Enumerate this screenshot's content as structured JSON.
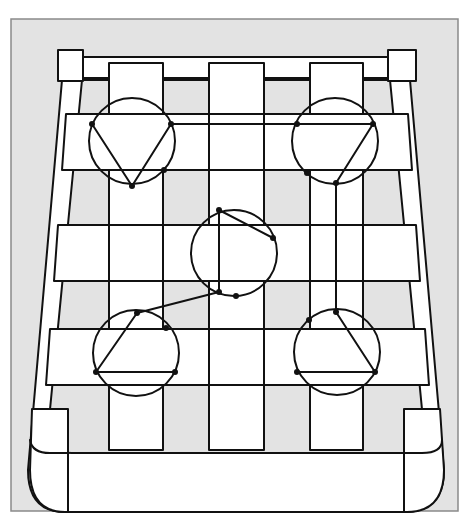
{
  "figure": {
    "title": "Woven strap seat with five-circle traversal path",
    "colors": {
      "panel_background": "#e3e3e3",
      "frame_border": "#8a8a8a",
      "line": "#111111",
      "fill": "#ffffff"
    }
  },
  "panel": {
    "x": 11,
    "y": 19,
    "w": 447,
    "h": 492
  },
  "frame": {
    "top_rail": {
      "x1": 82,
      "y1": 57,
      "x2": 388,
      "y2": 57
    },
    "top_inner": {
      "y": 78
    },
    "corner_blocks_top": [
      {
        "name": "corner-block-top-left",
        "x": 58,
        "y": 50,
        "w": 25,
        "h": 31
      },
      {
        "name": "corner-block-top-right",
        "x": 388,
        "y": 50,
        "w": 28,
        "h": 31
      }
    ],
    "corner_blocks_bottom": [
      {
        "name": "corner-block-bottom-left",
        "x": 32,
        "y": 409,
        "w": 36,
        "h": 124
      },
      {
        "name": "corner-block-bottom-right",
        "x": 404,
        "y": 409,
        "w": 40,
        "h": 124
      }
    ]
  },
  "vertical_straps": [
    {
      "name": "vertical-strap-left",
      "x": 109,
      "y": 63,
      "w": 54,
      "h": 387
    },
    {
      "name": "vertical-strap-center",
      "x": 209,
      "y": 63,
      "w": 55,
      "h": 387
    },
    {
      "name": "vertical-strap-right",
      "x": 310,
      "y": 63,
      "w": 53,
      "h": 387
    }
  ],
  "horizontal_straps": [
    {
      "name": "horizontal-strap-top",
      "y1": 114,
      "y2": 170,
      "xl_top": 66,
      "xl_bot": 62,
      "xr_top": 408,
      "xr_bot": 412
    },
    {
      "name": "horizontal-strap-middle",
      "y1": 225,
      "y2": 281,
      "xl_top": 58,
      "xl_bot": 54,
      "xr_top": 416,
      "xr_bot": 420
    },
    {
      "name": "horizontal-strap-bottom",
      "y1": 329,
      "y2": 385,
      "xl_top": 50,
      "xl_bot": 46,
      "xr_top": 425,
      "xr_bot": 429
    }
  ],
  "circles": [
    {
      "name": "circle-top-left",
      "cx": 132,
      "cy": 141,
      "r": 43
    },
    {
      "name": "circle-top-right",
      "cx": 335,
      "cy": 141,
      "r": 43
    },
    {
      "name": "circle-center",
      "cx": 234,
      "cy": 253,
      "r": 43
    },
    {
      "name": "circle-bottom-left",
      "cx": 136,
      "cy": 353,
      "r": 43
    },
    {
      "name": "circle-bottom-right",
      "cx": 337,
      "cy": 352,
      "r": 43
    }
  ],
  "path": {
    "segments": [
      [
        92,
        124,
        132,
        186
      ],
      [
        132,
        186,
        171,
        124
      ],
      [
        171,
        124,
        373,
        124
      ],
      [
        373,
        124,
        336,
        183
      ],
      [
        336,
        183,
        336,
        312
      ],
      [
        336,
        312,
        375,
        372
      ],
      [
        375,
        372,
        297,
        372
      ],
      [
        96,
        372,
        175,
        372
      ],
      [
        96,
        372,
        137,
        313
      ],
      [
        137,
        313,
        219,
        292
      ],
      [
        219,
        292,
        219,
        210
      ],
      [
        219,
        210,
        273,
        238
      ]
    ],
    "nodes": [
      [
        92,
        124
      ],
      [
        132,
        186
      ],
      [
        171,
        124
      ],
      [
        164,
        170
      ],
      [
        297,
        124
      ],
      [
        373,
        124
      ],
      [
        336,
        183
      ],
      [
        307,
        173
      ],
      [
        336,
        312
      ],
      [
        309,
        320
      ],
      [
        375,
        372
      ],
      [
        297,
        372
      ],
      [
        96,
        372
      ],
      [
        175,
        372
      ],
      [
        137,
        313
      ],
      [
        166,
        328
      ],
      [
        219,
        292
      ],
      [
        219,
        210
      ],
      [
        273,
        238
      ],
      [
        236,
        296
      ]
    ]
  }
}
